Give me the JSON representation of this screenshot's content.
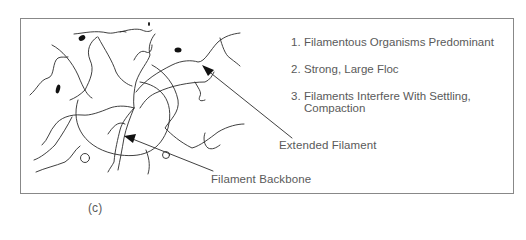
{
  "figure": {
    "panel_label": "(c)",
    "list": [
      {
        "number": "1.",
        "text": "Filamentous Organisms Predominant"
      },
      {
        "number": "2.",
        "text": "Strong, Large Floc"
      },
      {
        "number": "3.",
        "text": "Filaments Interfere With Settling,",
        "continuation": "Compaction"
      }
    ],
    "callouts": {
      "extended_filament": "Extended Filament",
      "filament_backbone": "Filament Backbone"
    },
    "colors": {
      "line": "#2a2a2a",
      "frame": "#888888",
      "text": "#5a5a5a"
    }
  }
}
